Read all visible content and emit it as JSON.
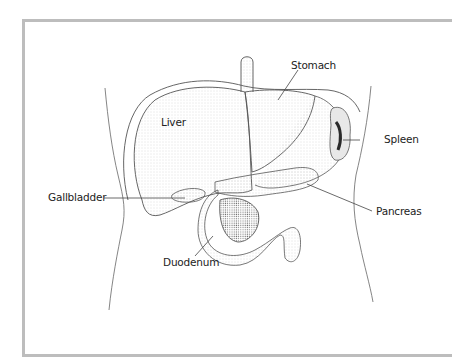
{
  "figure": {
    "labels": {
      "stomach": "Stomach",
      "liver": "Liver",
      "spleen": "Spleen",
      "gallbladder": "Gallbladder",
      "pancreas": "Pancreas",
      "duodenum": "Duodenum"
    },
    "colors": {
      "frame": "#bdbdbd",
      "line": "#555555",
      "stipple": "#c8c8c8",
      "spleen_dark": "#2a2a2a"
    }
  }
}
